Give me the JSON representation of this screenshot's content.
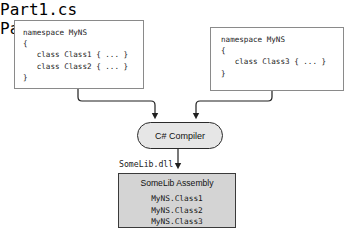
{
  "diagram": {
    "accent_color": "#e6e6e6",
    "assembly_fill": "#d4d4d4",
    "line_color": "#1f1f1f"
  },
  "sources": [
    {
      "file_label": "Part1.cs",
      "code": "namespace MyNS\n{\n   class Class1 { ... }\n   class Class2 { ... }\n}"
    },
    {
      "file_label": "Part2.cs",
      "code": "namespace MyNS\n{\n   class Class3 { ... }\n}"
    }
  ],
  "compiler": {
    "label": "C# Compiler"
  },
  "output": {
    "dll_label": "SomeLib.dll",
    "assembly_title": "SomeLib Assembly",
    "members": "MyNS.Class1\nMyNS.Class2\nMyNS.Class3"
  },
  "icons": {
    "arrow_down": "arrow-down-icon"
  }
}
